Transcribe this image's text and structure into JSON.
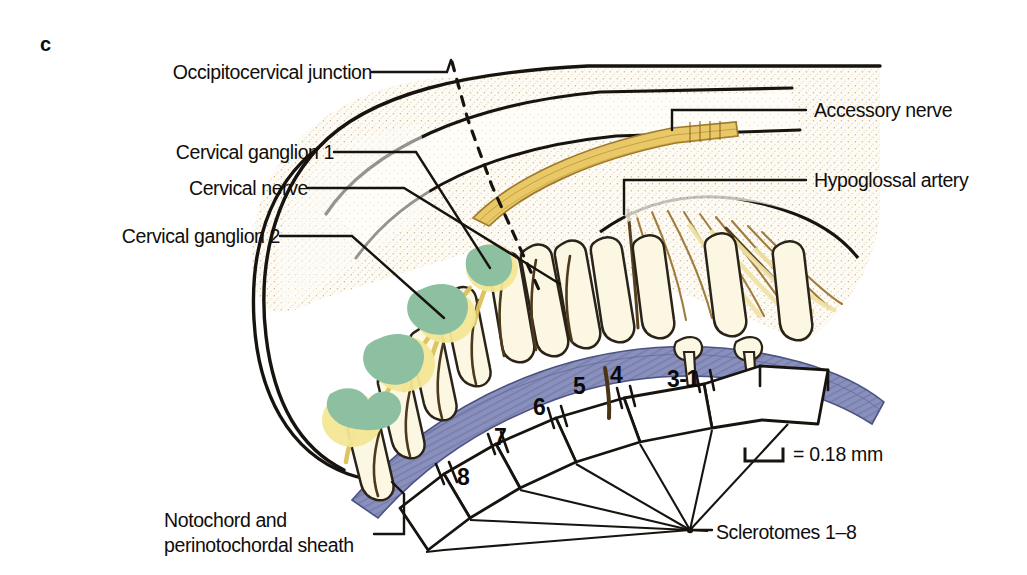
{
  "figure": {
    "panel_letter": "c",
    "background_color": "#ffffff"
  },
  "labels": {
    "occipitocervical_junction": "Occipitocervical junction",
    "cervical_ganglion_1": "Cervical ganglion 1",
    "cervical_nerve": "Cervical nerve",
    "cervical_ganglion_2": "Cervical ganglion 2",
    "accessory_nerve": "Accessory nerve",
    "hypoglossal_artery": "Hypoglossal artery",
    "notochord_line1": "Notochord and",
    "notochord_line2": "perinotochordal sheath",
    "sclerotomes": "Sclerotomes 1–8"
  },
  "sclerotome_numbers": [
    {
      "id": "3-1",
      "text": "3-1"
    },
    {
      "id": "4",
      "text": "4"
    },
    {
      "id": "5",
      "text": "5"
    },
    {
      "id": "6",
      "text": "6"
    },
    {
      "id": "7",
      "text": "7"
    },
    {
      "id": "8",
      "text": "8"
    }
  ],
  "scale_bar": {
    "equals": "=",
    "value": "0.18",
    "unit": "mm",
    "text": "= 0.18 mm"
  },
  "colors": {
    "ink": "#100d0b",
    "outline": "#1a1714",
    "ganglion_green": "#8cc0a0",
    "nerve_yellow": "#f2e08c",
    "accessory_gold": "#e8c868",
    "notochord_blue": "#8a90bc",
    "vertebra_cream": "#faf6e4",
    "tissue_stipple": "#c9b894",
    "fiber_brown": "#9a7336"
  }
}
